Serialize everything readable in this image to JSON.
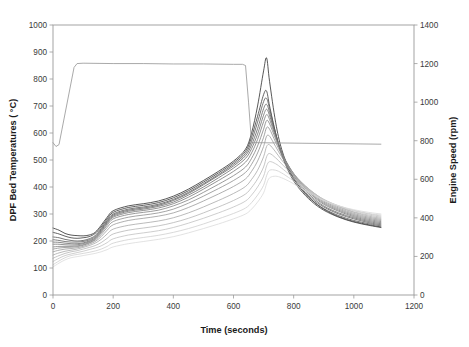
{
  "chart_data": {
    "type": "line",
    "title": "",
    "xlabel": "Time (seconds)",
    "ylabel": "DPF Bed Temperatures ( °C)",
    "y2label": "Engine Speed (rpm)",
    "xlim": [
      0,
      1200
    ],
    "ylim": [
      0,
      1000
    ],
    "y2lim": [
      0,
      1400
    ],
    "xticks": [
      0,
      200,
      400,
      600,
      800,
      1000,
      1200
    ],
    "yticks": [
      0,
      100,
      200,
      300,
      400,
      500,
      600,
      700,
      800,
      900,
      1000
    ],
    "y2ticks": [
      0,
      200,
      400,
      600,
      800,
      1000,
      1200,
      1400
    ],
    "grid": false,
    "legend": "none",
    "x": [
      0,
      20,
      40,
      60,
      80,
      100,
      120,
      140,
      160,
      180,
      200,
      250,
      300,
      350,
      400,
      450,
      500,
      550,
      600,
      640,
      660,
      680,
      700,
      710,
      720,
      740,
      760,
      790,
      820,
      860,
      900,
      950,
      1000,
      1050,
      1090
    ],
    "series": [
      {
        "name": "DPF bed temperature probe 1",
        "axis": "left",
        "units": "°C",
        "color": "#3a3a3a",
        "width": 0.85,
        "values": [
          248,
          240,
          228,
          222,
          220,
          219,
          222,
          232,
          258,
          288,
          312,
          330,
          338,
          348,
          366,
          392,
          424,
          458,
          496,
          540,
          600,
          700,
          830,
          878,
          790,
          640,
          540,
          452,
          400,
          352,
          318,
          290,
          272,
          260,
          252
        ]
      },
      {
        "name": "DPF bed temperature probe 2",
        "axis": "left",
        "units": "°C",
        "color": "#474747",
        "width": 0.85,
        "values": [
          232,
          226,
          218,
          212,
          210,
          212,
          216,
          228,
          252,
          282,
          306,
          324,
          332,
          342,
          360,
          386,
          418,
          452,
          490,
          532,
          585,
          662,
          742,
          755,
          700,
          600,
          520,
          442,
          392,
          346,
          314,
          288,
          270,
          258,
          250
        ]
      },
      {
        "name": "DPF bed temperature probe 3",
        "axis": "left",
        "units": "°C",
        "color": "#555555",
        "width": 0.8,
        "values": [
          215,
          212,
          206,
          202,
          200,
          202,
          208,
          220,
          246,
          276,
          300,
          318,
          326,
          336,
          354,
          380,
          412,
          446,
          484,
          524,
          570,
          640,
          716,
          728,
          690,
          600,
          524,
          448,
          398,
          352,
          320,
          294,
          276,
          264,
          256
        ]
      },
      {
        "name": "DPF bed temperature probe 4",
        "axis": "left",
        "units": "°C",
        "color": "#5f5f5f",
        "width": 0.8,
        "values": [
          205,
          202,
          198,
          196,
          196,
          198,
          204,
          216,
          242,
          272,
          296,
          314,
          322,
          332,
          350,
          376,
          408,
          442,
          478,
          516,
          556,
          616,
          690,
          706,
          676,
          596,
          526,
          454,
          404,
          358,
          326,
          300,
          282,
          268,
          260
        ]
      },
      {
        "name": "DPF bed temperature probe 5",
        "axis": "left",
        "units": "°C",
        "color": "#6b6b6b",
        "width": 0.8,
        "values": [
          196,
          195,
          192,
          190,
          190,
          193,
          200,
          212,
          238,
          268,
          292,
          310,
          318,
          328,
          344,
          370,
          400,
          434,
          470,
          506,
          542,
          596,
          666,
          688,
          664,
          592,
          528,
          460,
          410,
          364,
          330,
          304,
          286,
          272,
          264
        ]
      },
      {
        "name": "DPF bed temperature probe 6",
        "axis": "left",
        "units": "°C",
        "color": "#767676",
        "width": 0.8,
        "values": [
          188,
          188,
          186,
          185,
          186,
          190,
          197,
          209,
          234,
          264,
          288,
          305,
          313,
          322,
          338,
          362,
          392,
          424,
          458,
          492,
          526,
          576,
          642,
          668,
          650,
          586,
          528,
          464,
          416,
          370,
          336,
          310,
          290,
          276,
          268
        ]
      },
      {
        "name": "DPF bed temperature probe 7",
        "axis": "left",
        "units": "°C",
        "color": "#828282",
        "width": 0.8,
        "values": [
          178,
          180,
          180,
          180,
          182,
          186,
          194,
          206,
          230,
          258,
          282,
          298,
          306,
          314,
          330,
          352,
          380,
          410,
          442,
          474,
          506,
          552,
          614,
          646,
          634,
          578,
          526,
          466,
          420,
          374,
          340,
          314,
          294,
          280,
          272
        ]
      },
      {
        "name": "DPF bed temperature probe 8",
        "axis": "left",
        "units": "°C",
        "color": "#8e8e8e",
        "width": 0.8,
        "values": [
          170,
          174,
          176,
          177,
          179,
          184,
          192,
          203,
          224,
          250,
          272,
          288,
          296,
          304,
          318,
          340,
          366,
          394,
          424,
          454,
          484,
          526,
          584,
          620,
          614,
          566,
          520,
          466,
          422,
          378,
          344,
          318,
          298,
          284,
          276
        ]
      },
      {
        "name": "DPF bed temperature probe 9",
        "axis": "left",
        "units": "°C",
        "color": "#9a9a9a",
        "width": 0.8,
        "values": [
          160,
          166,
          170,
          172,
          175,
          180,
          188,
          198,
          216,
          240,
          260,
          276,
          284,
          292,
          304,
          324,
          348,
          374,
          402,
          430,
          458,
          496,
          550,
          588,
          588,
          550,
          512,
          464,
          424,
          382,
          348,
          322,
          302,
          288,
          280
        ]
      },
      {
        "name": "DPF bed temperature probe 10",
        "axis": "left",
        "units": "°C",
        "color": "#a8a8a8",
        "width": 0.8,
        "values": [
          148,
          156,
          162,
          166,
          170,
          176,
          183,
          192,
          206,
          226,
          244,
          258,
          266,
          274,
          286,
          304,
          326,
          350,
          376,
          402,
          428,
          462,
          512,
          550,
          556,
          530,
          500,
          460,
          424,
          384,
          352,
          326,
          306,
          292,
          284
        ]
      },
      {
        "name": "DPF bed temperature probe 11",
        "axis": "left",
        "units": "°C",
        "color": "#b6b6b6",
        "width": 0.8,
        "values": [
          136,
          146,
          154,
          160,
          164,
          170,
          176,
          183,
          194,
          210,
          226,
          240,
          248,
          256,
          268,
          284,
          304,
          326,
          350,
          374,
          398,
          430,
          474,
          512,
          524,
          508,
          486,
          452,
          420,
          384,
          354,
          328,
          308,
          296,
          288
        ]
      },
      {
        "name": "DPF bed temperature probe 12",
        "axis": "left",
        "units": "°C",
        "color": "#c2c2c2",
        "width": 0.8,
        "values": [
          124,
          136,
          146,
          152,
          157,
          162,
          168,
          174,
          182,
          194,
          208,
          222,
          230,
          238,
          250,
          266,
          284,
          304,
          326,
          348,
          370,
          400,
          440,
          478,
          494,
          486,
          470,
          442,
          414,
          382,
          354,
          330,
          312,
          300,
          292
        ]
      },
      {
        "name": "DPF bed temperature probe 13",
        "axis": "left",
        "units": "°C",
        "color": "#cfcfcf",
        "width": 0.8,
        "values": [
          112,
          126,
          138,
          146,
          150,
          154,
          158,
          163,
          170,
          180,
          192,
          205,
          213,
          221,
          232,
          246,
          263,
          282,
          302,
          322,
          342,
          370,
          406,
          442,
          462,
          462,
          452,
          430,
          406,
          378,
          352,
          330,
          314,
          302,
          296
        ]
      },
      {
        "name": "DPF bed temperature probe 14",
        "axis": "left",
        "units": "°C",
        "color": "#dadada",
        "width": 0.8,
        "values": [
          104,
          118,
          130,
          138,
          142,
          146,
          150,
          154,
          160,
          168,
          178,
          190,
          198,
          206,
          216,
          230,
          246,
          263,
          282,
          300,
          318,
          344,
          378,
          412,
          434,
          440,
          434,
          418,
          398,
          374,
          350,
          330,
          316,
          306,
          300
        ]
      },
      {
        "name": "Engine speed",
        "axis": "right",
        "units": "rpm",
        "color": "#9a9a9a",
        "width": 0.85,
        "x": [
          0,
          10,
          20,
          30,
          70,
          80,
          100,
          200,
          300,
          400,
          500,
          600,
          630,
          640,
          650,
          660,
          1090
        ],
        "values": [
          790,
          770,
          780,
          860,
          1180,
          1200,
          1202,
          1200,
          1200,
          1198,
          1198,
          1196,
          1196,
          1190,
          1000,
          790,
          782
        ]
      }
    ]
  }
}
